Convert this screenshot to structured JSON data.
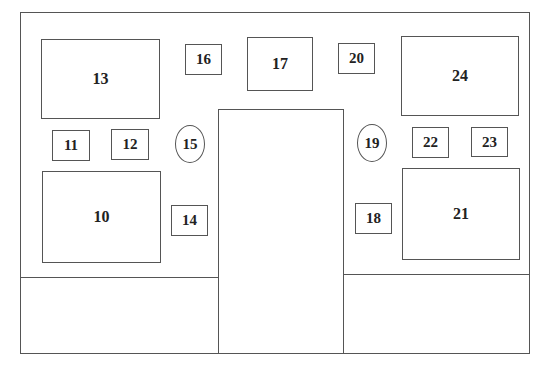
{
  "diagram": {
    "type": "floor-plan-layout",
    "components": [
      {
        "id": "13",
        "label": "13",
        "shape": "rectangle",
        "size": "large"
      },
      {
        "id": "16",
        "label": "16",
        "shape": "rectangle",
        "size": "small"
      },
      {
        "id": "17",
        "label": "17",
        "shape": "rectangle",
        "size": "medium"
      },
      {
        "id": "20",
        "label": "20",
        "shape": "rectangle",
        "size": "small"
      },
      {
        "id": "24",
        "label": "24",
        "shape": "rectangle",
        "size": "large"
      },
      {
        "id": "11",
        "label": "11",
        "shape": "rectangle",
        "size": "small"
      },
      {
        "id": "12",
        "label": "12",
        "shape": "rectangle",
        "size": "small"
      },
      {
        "id": "15",
        "label": "15",
        "shape": "ellipse",
        "size": "small"
      },
      {
        "id": "19",
        "label": "19",
        "shape": "ellipse",
        "size": "small"
      },
      {
        "id": "22",
        "label": "22",
        "shape": "rectangle",
        "size": "small"
      },
      {
        "id": "23",
        "label": "23",
        "shape": "rectangle",
        "size": "small"
      },
      {
        "id": "10",
        "label": "10",
        "shape": "rectangle",
        "size": "large"
      },
      {
        "id": "14",
        "label": "14",
        "shape": "rectangle",
        "size": "small"
      },
      {
        "id": "18",
        "label": "18",
        "shape": "rectangle",
        "size": "small"
      },
      {
        "id": "21",
        "label": "21",
        "shape": "rectangle",
        "size": "large"
      }
    ],
    "colors": {
      "line": "#555555",
      "text": "#222222",
      "background": "#ffffff"
    }
  },
  "labels": {
    "b10": "10",
    "b11": "11",
    "b12": "12",
    "b13": "13",
    "b14": "14",
    "b15": "15",
    "b16": "16",
    "b17": "17",
    "b18": "18",
    "b19": "19",
    "b20": "20",
    "b21": "21",
    "b22": "22",
    "b23": "23",
    "b24": "24"
  }
}
